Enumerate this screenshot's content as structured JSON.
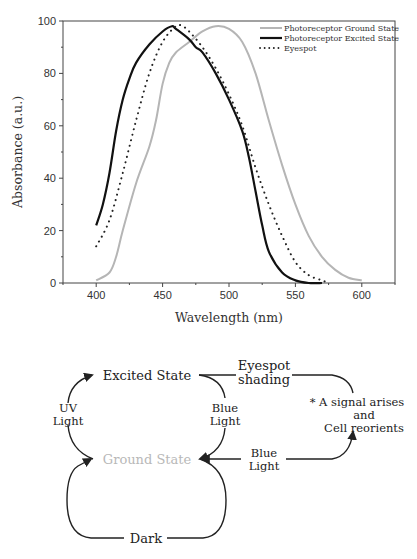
{
  "chart_data": {
    "type": "line",
    "title": "",
    "xlabel": "Wavelength (nm)",
    "ylabel": "Absorbance (a.u.)",
    "xlim": [
      375,
      625
    ],
    "ylim": [
      0,
      100
    ],
    "xticks": [
      400,
      450,
      500,
      550,
      600
    ],
    "yticks": [
      0,
      20,
      40,
      60,
      80,
      100
    ],
    "grid": false,
    "legend_position": "upper right",
    "series": [
      {
        "name": "Photoreceptor Ground State",
        "style": "solid",
        "color": "#b5b5b5",
        "x": [
          400,
          410,
          415,
          420,
          430,
          440,
          445,
          450,
          455,
          460,
          470,
          480,
          490,
          500,
          510,
          520,
          530,
          540,
          550,
          560,
          570,
          580,
          590,
          600
        ],
        "y": [
          1,
          4,
          10,
          20,
          38,
          52,
          62,
          76,
          84,
          88,
          92,
          96,
          98,
          97,
          92,
          80,
          62,
          45,
          30,
          18,
          10,
          5,
          2,
          1
        ]
      },
      {
        "name": "Photoreceptor Excited State",
        "style": "solid",
        "color": "#111111",
        "x": [
          400,
          405,
          410,
          415,
          420,
          425,
          430,
          440,
          450,
          457,
          460,
          470,
          475,
          480,
          490,
          500,
          510,
          515,
          520,
          525,
          530,
          540,
          550,
          560,
          570
        ],
        "y": [
          22,
          30,
          42,
          58,
          70,
          78,
          84,
          91,
          96,
          98,
          97,
          93,
          90,
          88,
          80,
          70,
          58,
          48,
          35,
          22,
          12,
          4,
          1,
          0,
          0
        ]
      },
      {
        "name": "Eyespot",
        "style": "dotted",
        "color": "#222222",
        "x": [
          400,
          410,
          420,
          430,
          440,
          450,
          460,
          465,
          470,
          480,
          490,
          500,
          510,
          520,
          530,
          540,
          550,
          560,
          570,
          575
        ],
        "y": [
          14,
          24,
          42,
          62,
          80,
          92,
          98,
          98,
          96,
          90,
          82,
          72,
          60,
          44,
          30,
          18,
          8,
          3,
          1,
          0
        ]
      }
    ]
  },
  "diagram": {
    "excited_state": "Excited State",
    "ground_state": "Ground State",
    "uv_light_1": "UV",
    "uv_light_2": "Light",
    "blue_light_1_a": "Blue",
    "blue_light_1_b": "Light",
    "blue_light_2_a": "Blue",
    "blue_light_2_b": "Light",
    "eyespot_1": "Eyespot",
    "eyespot_2": "shading",
    "signal_1": "* A signal arises",
    "signal_2": "and",
    "signal_3": "Cell reorients",
    "dark": "Dark"
  }
}
